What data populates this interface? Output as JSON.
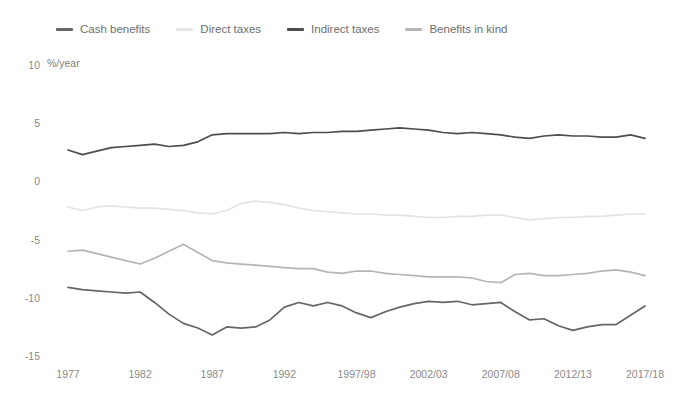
{
  "chart_data": {
    "type": "line",
    "title": "",
    "subtitle": "",
    "xlabel": "",
    "ylabel": "%/year",
    "unit_label": "%/year",
    "ylim": [
      -15,
      10
    ],
    "yticks": [
      10,
      5,
      0,
      -5,
      -10,
      -15
    ],
    "ytick_labels": [
      "10",
      "5",
      "0",
      "-5",
      "-10",
      "-15"
    ],
    "grid": false,
    "legend_position": "top-left",
    "x": [
      "1977",
      "1978",
      "1979",
      "1980",
      "1981",
      "1982",
      "1983",
      "1984",
      "1985",
      "1986",
      "1987",
      "1988",
      "1989",
      "1990",
      "1991",
      "1992",
      "1993/94",
      "1994/95",
      "1995/96",
      "1996/97",
      "1997/98",
      "1998/99",
      "1999/00",
      "2000/01",
      "2001/02",
      "2002/03",
      "2003/04",
      "2004/05",
      "2005/06",
      "2006/07",
      "2007/08",
      "2008/09",
      "2009/10",
      "2010/11",
      "2011/12",
      "2012/13",
      "2013/14",
      "2014/15",
      "2015/16",
      "2016/17",
      "2017/18"
    ],
    "xtick_labels": [
      "1977",
      "1982",
      "1987",
      "1992",
      "1997/98",
      "2002/03",
      "2007/08",
      "2012/13",
      "2017/18"
    ],
    "xtick_indices": [
      0,
      5,
      10,
      15,
      20,
      25,
      30,
      35,
      40
    ],
    "series": [
      {
        "name": "Cash benefits",
        "color": "#666666",
        "values": [
          -9.1,
          -9.3,
          -9.4,
          -9.5,
          -9.6,
          -9.5,
          -10.4,
          -11.4,
          -12.2,
          -12.6,
          -13.2,
          -12.5,
          -12.6,
          -12.5,
          -11.9,
          -10.8,
          -10.4,
          -10.7,
          -10.4,
          -10.7,
          -11.3,
          -11.7,
          -11.2,
          -10.8,
          -10.5,
          -10.3,
          -10.4,
          -10.3,
          -10.6,
          -10.5,
          -10.4,
          -11.2,
          -11.9,
          -11.8,
          -12.4,
          -12.8,
          -12.5,
          -12.3,
          -12.3,
          -11.5,
          -10.7
        ]
      },
      {
        "name": "Direct taxes",
        "color": "#e3e3e3",
        "values": [
          -2.2,
          -2.5,
          -2.2,
          -2.1,
          -2.2,
          -2.3,
          -2.3,
          -2.4,
          -2.5,
          -2.7,
          -2.8,
          -2.5,
          -1.9,
          -1.7,
          -1.8,
          -2.0,
          -2.3,
          -2.5,
          -2.6,
          -2.7,
          -2.8,
          -2.8,
          -2.9,
          -2.9,
          -3.0,
          -3.1,
          -3.1,
          -3.0,
          -3.0,
          -2.9,
          -2.9,
          -3.1,
          -3.3,
          -3.2,
          -3.1,
          -3.1,
          -3.0,
          -3.0,
          -2.9,
          -2.8,
          -2.8
        ]
      },
      {
        "name": "Indirect taxes",
        "color": "#4d4d4d",
        "values": [
          2.7,
          2.3,
          2.6,
          2.9,
          3.0,
          3.1,
          3.2,
          3.0,
          3.1,
          3.4,
          4.0,
          4.1,
          4.1,
          4.1,
          4.1,
          4.2,
          4.1,
          4.2,
          4.2,
          4.3,
          4.3,
          4.4,
          4.5,
          4.6,
          4.5,
          4.4,
          4.2,
          4.1,
          4.2,
          4.1,
          4.0,
          3.8,
          3.7,
          3.9,
          4.0,
          3.9,
          3.9,
          3.8,
          3.8,
          4.0,
          3.7
        ]
      },
      {
        "name": "Benefits in kind",
        "color": "#b5b5b5",
        "values": [
          -6.0,
          -5.9,
          -6.2,
          -6.5,
          -6.8,
          -7.1,
          -6.6,
          -6.0,
          -5.4,
          -6.1,
          -6.8,
          -7.0,
          -7.1,
          -7.2,
          -7.3,
          -7.4,
          -7.5,
          -7.5,
          -7.8,
          -7.9,
          -7.7,
          -7.7,
          -7.9,
          -8.0,
          -8.1,
          -8.2,
          -8.2,
          -8.2,
          -8.3,
          -8.6,
          -8.7,
          -8.0,
          -7.9,
          -8.1,
          -8.1,
          -8.0,
          -7.9,
          -7.7,
          -7.6,
          -7.8,
          -8.1
        ]
      }
    ]
  },
  "legend": {
    "items": [
      {
        "label": "Cash benefits",
        "color": "#666666"
      },
      {
        "label": "Direct taxes",
        "color": "#e3e3e3"
      },
      {
        "label": "Indirect taxes",
        "color": "#4d4d4d"
      },
      {
        "label": "Benefits in kind",
        "color": "#b5b5b5"
      }
    ]
  }
}
